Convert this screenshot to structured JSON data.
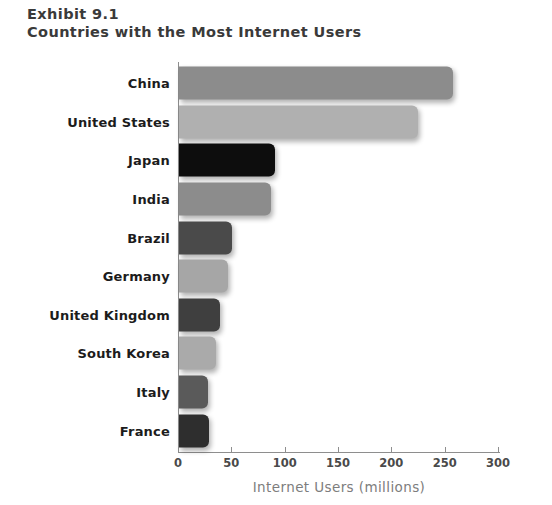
{
  "title": {
    "exhibit": "Exhibit 9.1",
    "subtitle": "Countries with the Most Internet Users"
  },
  "chart_data": {
    "type": "bar",
    "orientation": "horizontal",
    "title": "Exhibit 9.1 Countries with the Most Internet Users",
    "xlabel": "Internet Users (millions)",
    "ylabel": "",
    "xlim": [
      0,
      300
    ],
    "xticks": [
      0,
      50,
      100,
      150,
      200,
      250,
      300
    ],
    "grid": false,
    "legend": "none",
    "categories": [
      "China",
      "United States",
      "Japan",
      "India",
      "Brazil",
      "Germany",
      "United Kingdom",
      "South Korea",
      "Italy",
      "France"
    ],
    "values": [
      257,
      224,
      90,
      86,
      50,
      46,
      38,
      35,
      27,
      28
    ],
    "bar_colors": [
      "#8c8c8c",
      "#b0b0b0",
      "#0d0d0d",
      "#8c8c8c",
      "#4a4a4a",
      "#a6a6a6",
      "#3f3f3f",
      "#aaaaaa",
      "#5a5a5a",
      "#2e2e2e"
    ]
  },
  "axis": {
    "tick_labels": [
      "0",
      "50",
      "100",
      "150",
      "200",
      "250",
      "300"
    ],
    "x_title": "Internet Users (millions)"
  },
  "colors": {
    "axis_line": "#8e8e8e",
    "title_text": "#3a3a3a",
    "category_text": "#1c1c1c",
    "tick_text": "#4a4a4a",
    "axis_title_text": "#7d7d7d",
    "background": "#ffffff"
  }
}
